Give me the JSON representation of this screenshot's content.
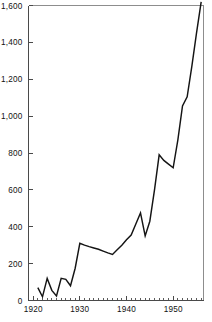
{
  "chart_data": {
    "type": "line",
    "title": "",
    "subtitle": "",
    "xlabel": "",
    "ylabel": "",
    "xlim": [
      1919.0,
      1956.5
    ],
    "ylim": [
      0,
      1600
    ],
    "grid": false,
    "legend": null,
    "series": [
      {
        "name": "value",
        "x": [
          1921,
          1922,
          1923,
          1924,
          1925,
          1926,
          1927,
          1928,
          1929,
          1930,
          1931,
          1932,
          1933,
          1934,
          1935,
          1936,
          1937,
          1938,
          1939,
          1940,
          1941,
          1942,
          1943,
          1944,
          1945,
          1946,
          1947,
          1948,
          1949,
          1950,
          1951,
          1952,
          1953,
          1954,
          1955,
          1956
        ],
        "values": [
          70,
          20,
          120,
          55,
          25,
          120,
          115,
          80,
          175,
          310,
          300,
          292,
          285,
          278,
          268,
          258,
          250,
          275,
          300,
          330,
          355,
          415,
          475,
          350,
          430,
          600,
          790,
          760,
          740,
          720,
          870,
          1055,
          1105,
          1270,
          1450,
          1620
        ]
      }
    ],
    "y_ticks": [
      {
        "value": 0,
        "label": "0"
      },
      {
        "value": 200,
        "label": "200"
      },
      {
        "value": 400,
        "label": "400"
      },
      {
        "value": 600,
        "label": "600"
      },
      {
        "value": 800,
        "label": "800"
      },
      {
        "value": 1000,
        "label": "1,000"
      },
      {
        "value": 1200,
        "label": "1,200"
      },
      {
        "value": 1400,
        "label": "1,400"
      },
      {
        "value": 1600,
        "label": "1,600"
      }
    ],
    "x_ticks_major": [
      {
        "value": 1920,
        "label": "1920"
      },
      {
        "value": 1930,
        "label": "1930"
      },
      {
        "value": 1940,
        "label": "1940"
      },
      {
        "value": 1950,
        "label": "1950"
      }
    ],
    "x_ticks_minor": [
      1921,
      1922,
      1923,
      1924,
      1925,
      1926,
      1927,
      1928,
      1929,
      1931,
      1932,
      1933,
      1934,
      1935,
      1936,
      1937,
      1938,
      1939,
      1941,
      1942,
      1943,
      1944,
      1945,
      1946,
      1947,
      1948,
      1949,
      1951,
      1952,
      1953,
      1954,
      1955,
      1956
    ],
    "colors": {
      "line": "#141414",
      "axis": "#4a4a4a",
      "frame": "#8d8d8d",
      "background": "#ffffff",
      "text": "#111111"
    }
  }
}
